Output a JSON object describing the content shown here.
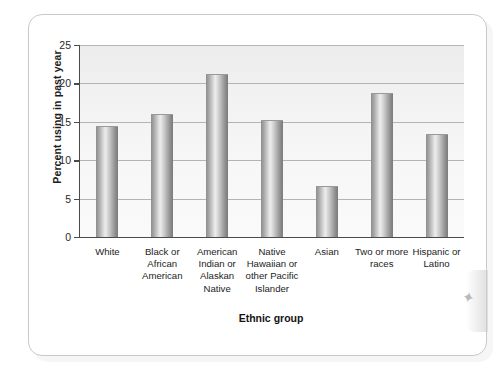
{
  "chart_data": {
    "type": "bar",
    "title": "",
    "xlabel": "Ethnic group",
    "ylabel": "Percent using in past year",
    "categories": [
      "White",
      "Black or African American",
      "American Indian or Alaskan Native",
      "Native Hawaiian or other Pacific Islander",
      "Asian",
      "Two or more races",
      "Hispanic or Latino"
    ],
    "values": [
      14.5,
      16.0,
      21.2,
      15.2,
      6.6,
      18.8,
      13.4
    ],
    "ylim": [
      0,
      25
    ],
    "yticks": [
      0,
      5,
      10,
      15,
      20,
      25
    ],
    "ytick_labels": [
      "0",
      "5",
      "10",
      "15",
      "20",
      "25"
    ],
    "grid": true,
    "legend": "none",
    "bar_color": "#b0b0b0",
    "plot_background": "#f2f2f2",
    "axis_color": "#4a4a4a",
    "gridline_color": "#b4b4b4"
  },
  "page": {
    "corner_mark": "✦"
  }
}
